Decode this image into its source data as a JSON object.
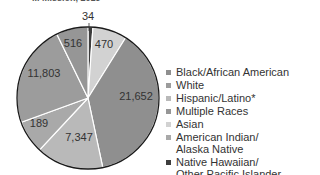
{
  "chart_data": {
    "type": "pie",
    "title": "",
    "title_partial_visible": "... Mission, 2019",
    "slices": [
      {
        "label": "Native Hawaiian/\nOther Pacific Islander",
        "value": 34,
        "color": "#3d3d3d",
        "start": 0,
        "end": 4,
        "label_pos": [
          88,
          20
        ]
      },
      {
        "label": "Asian",
        "value": 470,
        "color": "#d2d2d2",
        "start": 4,
        "end": 32,
        "label_pos": [
          104,
          48
        ]
      },
      {
        "label": "Black/African American",
        "value": 21652,
        "color": "#8f8f8f",
        "start": 32,
        "end": 168,
        "label_pos": [
          136,
          100
        ]
      },
      {
        "label": "Hispanic/Latino*",
        "value": 7347,
        "color": "#b9b9b9",
        "start": 168,
        "end": 223,
        "label_pos": [
          79,
          141
        ]
      },
      {
        "label": "American Indian/\nAlaska Native",
        "value": 189,
        "color": "#a9a9a9",
        "start": 223,
        "end": 250,
        "label_pos": [
          39,
          127
        ]
      },
      {
        "label": "White",
        "value": 11803,
        "color": "#9c9c9c",
        "start": 250,
        "end": 334,
        "label_pos": [
          44,
          77
        ]
      },
      {
        "label": "Multiple Races",
        "value": 516,
        "color": "#969696",
        "start": 334,
        "end": 360,
        "label_pos": [
          73,
          47
        ]
      }
    ],
    "value_labels": [
      "34",
      "470",
      "21,652",
      "7,347",
      "189",
      "11,803",
      "516"
    ],
    "legend_position": "right",
    "center": [
      88,
      98
    ],
    "radius": 71
  },
  "legend": {
    "items": [
      {
        "label": "Black/African American",
        "color": "#8f8f8f"
      },
      {
        "label": "White",
        "color": "#9c9c9c"
      },
      {
        "label": "Hispanic/Latino*",
        "color": "#b9b9b9"
      },
      {
        "label": "Multiple Races",
        "color": "#969696"
      },
      {
        "label": "Asian",
        "color": "#d2d2d2"
      },
      {
        "label": "American Indian/\nAlaska Native",
        "color": "#a9a9a9"
      },
      {
        "label": "Native Hawaiian/\nOther Pacific Islander",
        "color": "#3d3d3d"
      }
    ]
  },
  "title": "... Mission, 2019"
}
